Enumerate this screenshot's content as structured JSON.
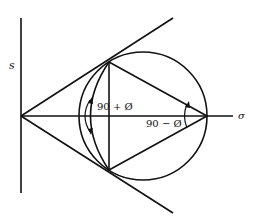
{
  "diagram": {
    "axes": {
      "vertical_label": "s",
      "horizontal_label": "σ"
    },
    "angle_labels": {
      "upper": "90 + Ø",
      "lower": "90 − Ø"
    },
    "colors": {
      "line": "#111111",
      "background": "#ffffff"
    }
  }
}
